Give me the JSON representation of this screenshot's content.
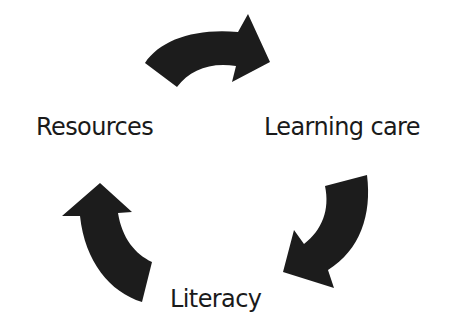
{
  "diagram": {
    "type": "cycle",
    "nodes": [
      {
        "id": "resources",
        "label": "Resources"
      },
      {
        "id": "learning_care",
        "label": "Learning care"
      },
      {
        "id": "literacy",
        "label": "Literacy"
      }
    ],
    "edges": [
      {
        "from": "resources",
        "to": "learning_care",
        "style": "curved-arrow"
      },
      {
        "from": "learning_care",
        "to": "literacy",
        "style": "curved-arrow"
      },
      {
        "from": "literacy",
        "to": "resources",
        "style": "curved-arrow"
      }
    ],
    "colors": {
      "arrow": "#1c1c1c",
      "text": "#1a1a1a",
      "background": "#ffffff"
    }
  }
}
